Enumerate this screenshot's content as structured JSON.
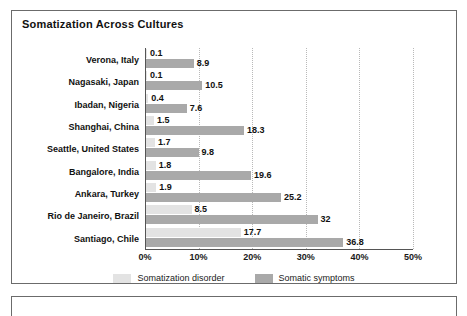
{
  "figure": {
    "title": "Somatization Across Cultures",
    "border_color": "#6b6b6b"
  },
  "legend": {
    "position": "bottom-center",
    "items": [
      {
        "label": "Somatization disorder",
        "color": "#e3e3e3",
        "icon": "legend-swatch"
      },
      {
        "label": "Somatic symptoms",
        "color": "#a9a9a9",
        "icon": "legend-swatch"
      }
    ]
  },
  "axis": {
    "ticks": [
      "0%",
      "10%",
      "20%",
      "30%",
      "40%",
      "50%"
    ],
    "tick_values": [
      0,
      10,
      20,
      30,
      40,
      50
    ]
  },
  "chart_data": {
    "type": "bar",
    "orientation": "horizontal",
    "title": "Somatization Across Cultures",
    "xlabel": "",
    "ylabel": "",
    "xlim": [
      0,
      50
    ],
    "xticks": [
      0,
      10,
      20,
      30,
      40,
      50
    ],
    "xtick_labels": [
      "0%",
      "10%",
      "20%",
      "30%",
      "40%",
      "50%"
    ],
    "grid": "vertical-dotted",
    "legend_position": "bottom-center",
    "categories": [
      "Verona, Italy",
      "Nagasaki, Japan",
      "Ibadan, Nigeria",
      "Shanghai, China",
      "Seattle, United States",
      "Bangalore, India",
      "Ankara, Turkey",
      "Rio de Janeiro, Brazil",
      "Santiago, Chile"
    ],
    "series": [
      {
        "name": "Somatization disorder",
        "color": "#e3e3e3",
        "values": [
          0.1,
          0.1,
          0.4,
          1.5,
          1.7,
          1.8,
          1.9,
          8.5,
          17.7
        ],
        "labels": [
          "0.1",
          "0.1",
          "0.4",
          "1.5",
          "1.7",
          "1.8",
          "1.9",
          "8.5",
          "17.7"
        ]
      },
      {
        "name": "Somatic symptoms",
        "color": "#a9a9a9",
        "values": [
          8.9,
          10.5,
          7.6,
          18.3,
          9.8,
          19.6,
          25.2,
          32,
          36.8
        ],
        "labels": [
          "8.9",
          "10.5",
          "7.6",
          "18.3",
          "9.8",
          "19.6",
          "25.2",
          "32",
          "36.8"
        ]
      }
    ]
  }
}
